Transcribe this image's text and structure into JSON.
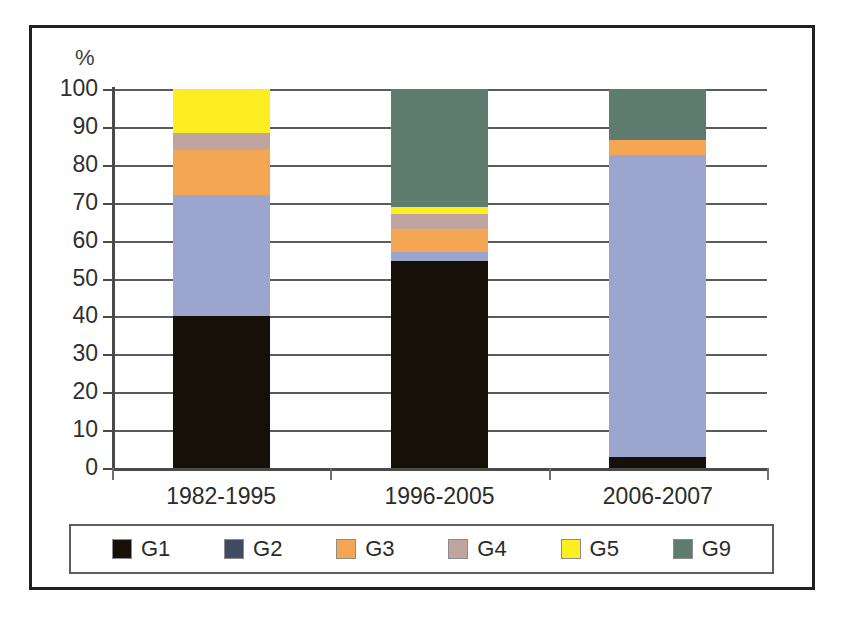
{
  "chart_data": {
    "type": "bar",
    "subtype": "stacked-100-percent",
    "title": "",
    "xlabel": "",
    "ylabel": "%",
    "ylim": [
      0,
      100
    ],
    "ytick_labels": [
      "100",
      "90",
      "80",
      "70",
      "60",
      "50",
      "40",
      "30",
      "20",
      "10",
      "0"
    ],
    "ytick_values": [
      100,
      90,
      80,
      70,
      60,
      50,
      40,
      30,
      20,
      10,
      0
    ],
    "grid": true,
    "grid_axis": "y",
    "legend_position": "bottom",
    "categories": [
      "1982-1995",
      "1996-2005",
      "2006-2007"
    ],
    "series": [
      {
        "name": "G1",
        "color": "#171008",
        "values": [
          40.0,
          54.5,
          3.0
        ]
      },
      {
        "name": "G2",
        "color": "#9ba5ce",
        "legend_color": "#3f4a63",
        "values": [
          32.0,
          2.5,
          79.5
        ]
      },
      {
        "name": "G3",
        "color": "#f5a653",
        "values": [
          12.0,
          6.0,
          4.0
        ]
      },
      {
        "name": "G4",
        "color": "#c2a49f",
        "values": [
          4.5,
          4.0,
          0.0
        ]
      },
      {
        "name": "G5",
        "color": "#fcee21",
        "values": [
          11.5,
          2.0,
          0.0
        ]
      },
      {
        "name": "G9",
        "color": "#5e7d6e",
        "values": [
          0.0,
          31.0,
          13.5
        ]
      }
    ],
    "stack_order_bottom_to_top": [
      "G1",
      "G2",
      "G3",
      "G4",
      "G5",
      "G9"
    ],
    "cumulative_tops": {
      "1982-1995": {
        "G1": 40.0,
        "G2": 72.0,
        "G3": 84.0,
        "G4": 88.5,
        "G5": 100.0
      },
      "1996-2005": {
        "G1": 54.5,
        "G2": 57.0,
        "G3": 63.0,
        "G4": 67.0,
        "G5": 69.0,
        "G9": 100.0
      },
      "2006-2007": {
        "G1": 3.0,
        "G2": 82.5,
        "G3": 86.5,
        "G9": 100.0
      }
    }
  },
  "legend": {
    "items": [
      {
        "label": "G1"
      },
      {
        "label": "G2"
      },
      {
        "label": "G3"
      },
      {
        "label": "G4"
      },
      {
        "label": "G5"
      },
      {
        "label": "G9"
      }
    ]
  }
}
